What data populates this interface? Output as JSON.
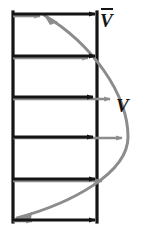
{
  "figure": {
    "labels": {
      "mean_velocity": "V",
      "mean_velocity_accent": "overbar",
      "velocity": "V"
    },
    "colors": {
      "wall": "#141414",
      "mean_arrow": "#141414",
      "profile_curve": "#8c8c8c",
      "profile_arrow": "#8c8c8c",
      "background": "#ffffff",
      "label": "#141414"
    },
    "duct": {
      "left_wall_x": 12,
      "right_wall_x": 97,
      "top_y": 13,
      "bottom_y": 221,
      "wall_stroke_width": 3
    },
    "mean_velocity_arrows": [
      {
        "y": 14,
        "x_start": 13,
        "x_end": 96
      },
      {
        "y": 56,
        "x_start": 13,
        "x_end": 96
      },
      {
        "y": 97,
        "x_start": 13,
        "x_end": 96
      },
      {
        "y": 137,
        "x_start": 13,
        "x_end": 96
      },
      {
        "y": 179,
        "x_start": 13,
        "x_end": 96
      },
      {
        "y": 220,
        "x_start": 13,
        "x_end": 96
      }
    ],
    "profile_velocity_arrows": [
      {
        "y": 14,
        "x_start": 13,
        "x_end": 40,
        "note": "near wall, small"
      },
      {
        "y": 56,
        "x_start": 13,
        "x_end": 88,
        "note": ""
      },
      {
        "y": 97,
        "x_start": 13,
        "x_end": 110,
        "note": ""
      },
      {
        "y": 137,
        "x_start": 13,
        "x_end": 122,
        "note": "centerline, maximum"
      },
      {
        "y": 179,
        "x_start": 13,
        "x_end": 102,
        "note": ""
      },
      {
        "y": 220,
        "x_start": 13,
        "x_end": 30,
        "note": "near wall, small"
      }
    ],
    "profile_curve": {
      "type": "parabola",
      "start": {
        "x": 44,
        "y": 15
      },
      "apex": {
        "x": 128,
        "y": 137
      },
      "end": {
        "x": 16,
        "y": 218
      },
      "stroke_width": 3,
      "arrowhead_start": "up-left",
      "arrowhead_end": "down-left"
    }
  }
}
